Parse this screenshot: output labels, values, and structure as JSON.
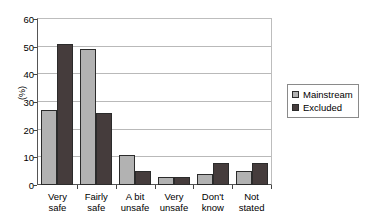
{
  "chart_data": {
    "type": "bar",
    "title": "",
    "xlabel": "",
    "ylabel": "(%)",
    "ylim": [
      0,
      60
    ],
    "ytick_step": 10,
    "yticks": [
      "0",
      "10",
      "20",
      "30",
      "40",
      "50",
      "60"
    ],
    "grid": true,
    "legend_position": "right",
    "categories": [
      "Very\nsafe",
      "Fairly\nsafe",
      "A bit\nunsafe",
      "Very\nunsafe",
      "Don't\nknow",
      "Not\nstated"
    ],
    "series": [
      {
        "name": "Mainstream",
        "color": "#b2b2b2",
        "values": [
          27,
          49,
          11,
          3,
          4,
          5
        ]
      },
      {
        "name": "Excluded",
        "color": "#453c3c",
        "values": [
          51,
          26,
          5,
          3,
          8,
          8
        ]
      }
    ]
  },
  "legend": {
    "items": [
      {
        "label": "Mainstream",
        "color": "#b2b2b2"
      },
      {
        "label": "Excluded",
        "color": "#453c3c"
      }
    ]
  },
  "axes": {
    "y_title": "(%)"
  }
}
